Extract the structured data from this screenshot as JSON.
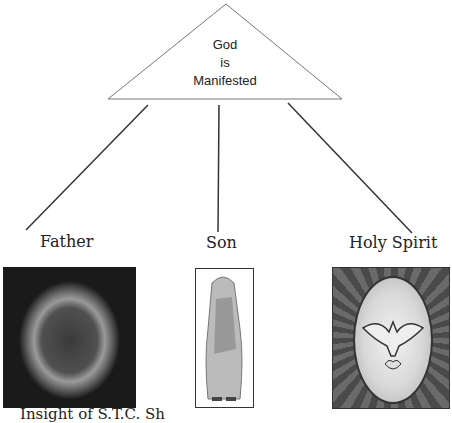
{
  "diagram": {
    "top_node": {
      "lines": [
        "God",
        "is",
        "Manifested"
      ]
    },
    "branches": [
      {
        "label": "Father",
        "image": "nebula-image"
      },
      {
        "label": "Son",
        "image": "jesus-figure-image"
      },
      {
        "label": "Holy Spirit",
        "image": "dove-stained-glass-image"
      }
    ],
    "footer_text": "Insight of S.T.C. Sh"
  }
}
